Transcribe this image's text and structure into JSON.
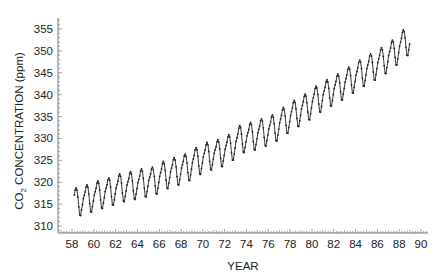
{
  "chart_data": {
    "type": "line",
    "title": "",
    "xlabel": "YEAR",
    "ylabel": "CO2 CONCENTRATION (ppm)",
    "ylabel_parts": {
      "main": "CO",
      "sub": "2",
      "rest": " CONCENTRATION (ppm)"
    },
    "xlim": [
      56.5,
      90.3
    ],
    "ylim": [
      308.5,
      357.5
    ],
    "x_ticks": [
      58,
      60,
      62,
      64,
      66,
      68,
      70,
      72,
      74,
      76,
      78,
      80,
      82,
      84,
      86,
      88,
      90
    ],
    "x_tick_labels": [
      "58",
      "60",
      "62",
      "64",
      "66",
      "68",
      "70",
      "72",
      "74",
      "76",
      "78",
      "80",
      "82",
      "84",
      "86",
      "88",
      "90"
    ],
    "y_ticks": [
      310,
      315,
      320,
      325,
      330,
      335,
      340,
      345,
      350,
      355
    ],
    "y_tick_labels": [
      "310",
      "315",
      "320",
      "325",
      "330",
      "335",
      "340",
      "345",
      "350",
      "355"
    ],
    "grid": false,
    "legend": null,
    "series": [
      {
        "name": "Monthly mean CO2 (ppm)",
        "color": "#222222",
        "marker": "dot",
        "annual_means": {
          "x": [
            58,
            59,
            60,
            61,
            62,
            63,
            64,
            65,
            66,
            67,
            68,
            69,
            70,
            71,
            72,
            73,
            74,
            75,
            76,
            77,
            78,
            79,
            80,
            81,
            82,
            83,
            84,
            85,
            86,
            87,
            88,
            89
          ],
          "values": [
            315.3,
            316.0,
            316.9,
            317.6,
            318.5,
            319.0,
            319.6,
            320.0,
            321.4,
            322.2,
            323.0,
            324.6,
            325.7,
            326.3,
            327.5,
            329.7,
            330.2,
            331.1,
            332.0,
            333.8,
            335.4,
            336.8,
            338.7,
            340.1,
            341.4,
            343.0,
            344.6,
            346.0,
            347.4,
            349.2,
            351.6,
            353.1
          ]
        },
        "seasonal_cycle_offsets": [
          0.6,
          1.3,
          2.0,
          3.1,
          3.5,
          2.9,
          1.3,
          -1.0,
          -2.9,
          -3.1,
          -1.9,
          -0.7
        ],
        "start_x": 58.2,
        "end_x": 89.0
      }
    ]
  }
}
